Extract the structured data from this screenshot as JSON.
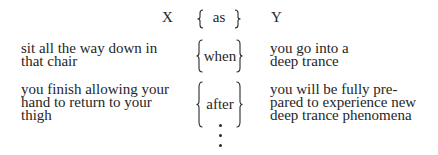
{
  "header": {
    "left": "X",
    "connector": "as",
    "right": "Y"
  },
  "rows": [
    {
      "left_lines": [
        "sit all the way down in",
        "that chair"
      ],
      "connector": "when",
      "right_lines": [
        "you go into a",
        "deep trance"
      ]
    },
    {
      "left_lines": [
        "you finish allowing your",
        "hand to return to your",
        "thigh"
      ],
      "connector": "after",
      "right_lines": [
        "you will be fully pre-",
        "pared to experience new",
        "deep trance phenomena"
      ]
    }
  ],
  "continuation": "vertical-ellipsis"
}
